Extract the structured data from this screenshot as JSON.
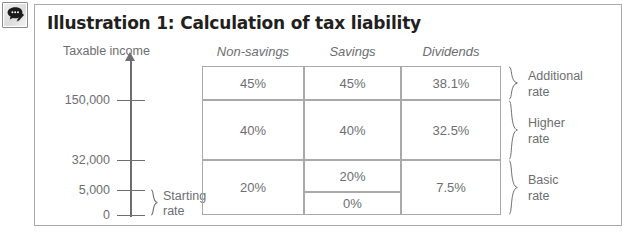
{
  "window": {
    "annotation_icon": "comment-pencil-icon"
  },
  "figure": {
    "title": "Illustration 1: Calculation of tax liability",
    "axis": {
      "label": "Taxable income",
      "ticks": [
        {
          "value": "150,000",
          "y": 100
        },
        {
          "value": "32,000",
          "y": 160
        },
        {
          "value": "5,000",
          "y": 190
        },
        {
          "value": "0",
          "y": 215
        }
      ],
      "starting_rate_label_line1": "Starting",
      "starting_rate_label_line2": "rate"
    },
    "table": {
      "columns": [
        "Non-savings",
        "Savings",
        "Dividends"
      ],
      "rows": [
        {
          "band": "Additional rate",
          "non_savings": "45%",
          "savings": "45%",
          "dividends": "38.1%"
        },
        {
          "band": "Higher rate",
          "non_savings": "40%",
          "savings": "40%",
          "dividends": "32.5%"
        },
        {
          "band": "Basic rate",
          "non_savings": "20%",
          "savings": [
            "20%",
            "0%"
          ],
          "dividends": "7.5%"
        }
      ]
    },
    "bands": [
      {
        "line1": "Additional",
        "line2": "rate"
      },
      {
        "line1": "Higher",
        "line2": "rate"
      },
      {
        "line1": "Basic",
        "line2": "rate"
      }
    ]
  },
  "colors": {
    "ink": "#6d6e71",
    "title": "#231f20",
    "rule": "#a7a9ac",
    "background": "#ffffff"
  }
}
